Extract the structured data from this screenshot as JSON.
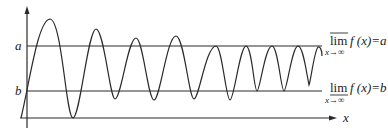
{
  "diagram": {
    "type": "oscillating function with limsup and liminf bounds",
    "axes": {
      "x_label": "x",
      "y_label": ""
    },
    "levels": [
      {
        "name": "a",
        "label": "a",
        "y_px": 46
      },
      {
        "name": "b",
        "label": "b",
        "y_px": 91
      }
    ],
    "annotations": {
      "limsup": {
        "operator": "lim",
        "overline": true,
        "subscript": "x→∞",
        "expression": "f (x)=a"
      },
      "liminf": {
        "operator": "lim",
        "underline": true,
        "subscript": "x→∞",
        "expression": "f (x)=b"
      }
    },
    "colors": {
      "stroke": "#2a2a2a",
      "background": "#ffffff"
    }
  }
}
